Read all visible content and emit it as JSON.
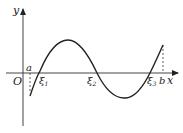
{
  "diagram": {
    "axes": {
      "x_label": "x",
      "y_label": "y",
      "origin_label": "O"
    },
    "points": {
      "a": "a",
      "b": "b",
      "xi1": "ξ",
      "xi1_sub": "1",
      "xi2": "ξ",
      "xi2_sub": "2",
      "xi3": "ξ",
      "xi3_sub": "3"
    },
    "colors": {
      "line": "#222222",
      "background": "#ffffff"
    }
  }
}
